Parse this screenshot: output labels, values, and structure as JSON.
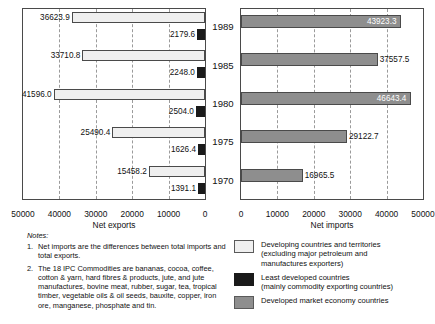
{
  "chart_data": [
    {
      "type": "bar",
      "title": "",
      "xlabel": "Net exports",
      "ylabel": "",
      "orientation": "horizontal",
      "direction": "reversed",
      "xlim": [
        0,
        50000
      ],
      "xticks": [
        "50000",
        "40000",
        "30000",
        "20000",
        "10000",
        "0"
      ],
      "xtick_values": [
        50000,
        40000,
        30000,
        20000,
        10000,
        0
      ],
      "grid": true,
      "categories": [
        "1989",
        "1985",
        "1980",
        "1975",
        "1970"
      ],
      "series": [
        {
          "name": "Developing countries and territories (excluding major petroleum and manufactures exporters)",
          "color": "#efefef",
          "values": [
            36623.9,
            33710.8,
            41596.0,
            25490.4,
            15458.2
          ],
          "labels": [
            "36623.9",
            "33710.8",
            "41596.0",
            "25490.4",
            "15458.2"
          ]
        },
        {
          "name": "Least developed countries (mainly commodity exporting countries)",
          "color": "#1a1a1a",
          "values": [
            2179.6,
            2248.0,
            2504.0,
            1626.4,
            1391.1
          ],
          "labels": [
            "2179.6",
            "2248.0",
            "2504.0",
            "1626.4",
            "1391.1"
          ]
        }
      ]
    },
    {
      "type": "bar",
      "title": "",
      "xlabel": "Net imports",
      "ylabel": "",
      "orientation": "horizontal",
      "direction": "normal",
      "xlim": [
        0,
        50000
      ],
      "xticks": [
        "0",
        "10000",
        "20000",
        "30000",
        "40000",
        "50000"
      ],
      "xtick_values": [
        0,
        10000,
        20000,
        30000,
        40000,
        50000
      ],
      "grid": true,
      "categories": [
        "1989",
        "1985",
        "1980",
        "1975",
        "1970"
      ],
      "series": [
        {
          "name": "Developed market economy countries",
          "color": "#8e8e8e",
          "values": [
            43923.3,
            37557.5,
            46643.4,
            29122.7,
            16965.5
          ],
          "labels": [
            "43923.3",
            "37557.5",
            "46643.4",
            "29122.7",
            "16965.5"
          ],
          "label_inside": [
            true,
            false,
            true,
            false,
            false
          ]
        }
      ]
    }
  ],
  "years": [
    "1989",
    "1985",
    "1980",
    "1975",
    "1970"
  ],
  "axes": {
    "left_title": "Net exports",
    "right_title": "Net imports",
    "left_ticks": [
      "50000",
      "40000",
      "30000",
      "20000",
      "10000",
      "0"
    ],
    "right_ticks": [
      "0",
      "10000",
      "20000",
      "30000",
      "40000",
      "50000"
    ]
  },
  "notes": {
    "title": "Notes:",
    "items": [
      {
        "num": "1.",
        "text": "Net imports are the differences between total imports and total exports."
      },
      {
        "num": "2.",
        "text": "The 18 IPC Commodities are bananas, cocoa, coffee, cotton & yarn, hard fibres & products, jute, and jute manufactures, bovine meat, rubber, sugar, tea, tropical timber, vegetable oils &  oil seeds, bauxite, copper, iron ore, manganese, phosphate and tin."
      }
    ]
  },
  "legend": {
    "items": [
      {
        "swatch": "devg",
        "color": "#efefef",
        "line1": "Developing countries and territories",
        "line2": "(excluding major petroleum and",
        "line3": "manufactures exporters)"
      },
      {
        "swatch": "least",
        "color": "#1a1a1a",
        "line1": "Least developed countries",
        "line2": "(mainly commodity exporting countries)",
        "line3": ""
      },
      {
        "swatch": "devd",
        "color": "#8e8e8e",
        "line1": "Developed market economy countries",
        "line2": "",
        "line3": ""
      }
    ]
  }
}
